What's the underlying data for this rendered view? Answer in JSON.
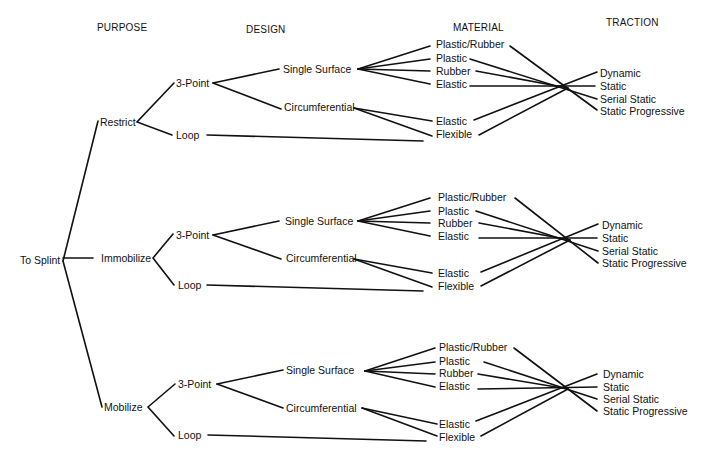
{
  "headers": {
    "purpose": "PURPOSE",
    "design": "DESIGN",
    "material": "MATERIAL",
    "traction": "TRACTION"
  },
  "root": "To Splint",
  "sections": [
    {
      "purpose": "Restrict",
      "design": [
        "3-Point",
        "Loop"
      ],
      "sub_design": [
        "Single Surface",
        "Circumferential"
      ],
      "material": [
        "Plastic/Rubber",
        "Plastic",
        "Rubber",
        "Elastic",
        "Elastic",
        "Flexible"
      ],
      "traction": [
        "Dynamic",
        "Static",
        "Serial Static",
        "Static Progressive"
      ]
    },
    {
      "purpose": "Immobilize",
      "design": [
        "3-Point",
        "Loop"
      ],
      "sub_design": [
        "Single Surface",
        "Circumferential"
      ],
      "material": [
        "Plastic/Rubber",
        "Plastic",
        "Rubber",
        "Elastic",
        "Elastic",
        "Flexible"
      ],
      "traction": [
        "Dynamic",
        "Static",
        "Serial Static",
        "Static Progressive"
      ]
    },
    {
      "purpose": "Mobilize",
      "design": [
        "3-Point",
        "Loop"
      ],
      "sub_design": [
        "Single Surface",
        "Circumferential"
      ],
      "material": [
        "Plastic/Rubber",
        "Plastic",
        "Rubber",
        "Elastic",
        "Elastic",
        "Flexible"
      ],
      "traction": [
        "Dynamic",
        "Static",
        "Serial Static",
        "Static Progressive"
      ]
    }
  ]
}
